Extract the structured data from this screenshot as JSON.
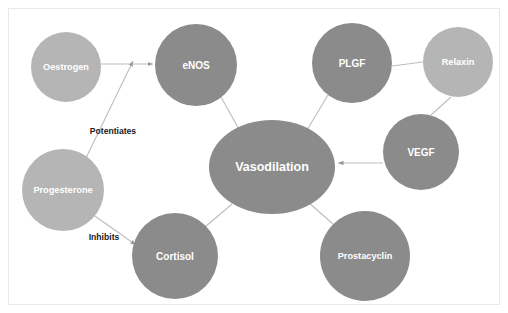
{
  "diagram": {
    "background_color": "#ffffff",
    "frame_color": "#e9e9e9",
    "edge_color": "#bdbdbd",
    "palette": {
      "dark_node": "#8b8b8b",
      "light_node": "#b5b5b5",
      "node_text": "#ffffff",
      "edge_label_text": "#1a1a1a"
    },
    "nodes": [
      {
        "id": "vasodilation",
        "label": "Vasodilation",
        "shape": "ellipse",
        "cx": 272,
        "cy": 167,
        "rx": 63,
        "ry": 47,
        "color": "#8b8b8b",
        "size_class": "center"
      },
      {
        "id": "oestrogen",
        "label": "Oestrogen",
        "shape": "circle",
        "cx": 66,
        "cy": 67,
        "rx": 35,
        "ry": 35,
        "color": "#b5b5b5",
        "size_class": "med"
      },
      {
        "id": "enos",
        "label": "eNOS",
        "shape": "circle",
        "cx": 196,
        "cy": 65,
        "rx": 41,
        "ry": 41,
        "color": "#8b8b8b",
        "size_class": "big"
      },
      {
        "id": "plgf",
        "label": "PLGF",
        "shape": "circle",
        "cx": 352,
        "cy": 63,
        "rx": 40,
        "ry": 40,
        "color": "#8b8b8b",
        "size_class": "big"
      },
      {
        "id": "relaxin",
        "label": "Relaxin",
        "shape": "circle",
        "cx": 458,
        "cy": 62,
        "rx": 35,
        "ry": 35,
        "color": "#b5b5b5",
        "size_class": "med"
      },
      {
        "id": "vegf",
        "label": "VEGF",
        "shape": "circle",
        "cx": 421,
        "cy": 152,
        "rx": 38,
        "ry": 38,
        "color": "#8b8b8b",
        "size_class": "big"
      },
      {
        "id": "progesterone",
        "label": "Progesterone",
        "shape": "circle",
        "cx": 63,
        "cy": 190,
        "rx": 41,
        "ry": 41,
        "color": "#b5b5b5",
        "size_class": "med"
      },
      {
        "id": "cortisol",
        "label": "Cortisol",
        "shape": "circle",
        "cx": 175,
        "cy": 256,
        "rx": 43,
        "ry": 43,
        "color": "#8b8b8b",
        "size_class": "big"
      },
      {
        "id": "prostacyclin",
        "label": "Prostacyclin",
        "shape": "circle",
        "cx": 365,
        "cy": 256,
        "rx": 45,
        "ry": 45,
        "color": "#8b8b8b",
        "size_class": "med"
      }
    ],
    "edges": [
      {
        "id": "oestrogen-enos",
        "from": "oestrogen",
        "to": "enos",
        "label": "",
        "arrow": true,
        "x1": 101,
        "y1": 64,
        "x2": 153,
        "y2": 64
      },
      {
        "id": "progesterone-enos",
        "from": "progesterone",
        "to": "enos",
        "label": "Potentiates",
        "arrow": true,
        "x1": 86,
        "y1": 158,
        "x2": 133,
        "y2": 61
      },
      {
        "id": "progesterone-cortisol",
        "from": "progesterone",
        "to": "cortisol",
        "label": "Inhibits",
        "arrow": true,
        "x1": 92,
        "y1": 214,
        "x2": 136,
        "y2": 245
      },
      {
        "id": "enos-vasodilation",
        "from": "enos",
        "to": "vasodilation",
        "label": "",
        "arrow": false,
        "x1": 221,
        "y1": 97,
        "x2": 240,
        "y2": 131
      },
      {
        "id": "plgf-vasodilation",
        "from": "plgf",
        "to": "vasodilation",
        "label": "",
        "arrow": false,
        "x1": 328,
        "y1": 95,
        "x2": 307,
        "y2": 130
      },
      {
        "id": "plgf-relaxin",
        "from": "plgf",
        "to": "relaxin",
        "label": "",
        "arrow": false,
        "x1": 392,
        "y1": 66,
        "x2": 423,
        "y2": 62
      },
      {
        "id": "relaxin-vegf",
        "from": "relaxin",
        "to": "vegf",
        "label": "",
        "arrow": false,
        "x1": 451,
        "y1": 97,
        "x2": 431,
        "y2": 115
      },
      {
        "id": "vegf-vasodilation",
        "from": "vegf",
        "to": "vasodilation",
        "label": "",
        "arrow": true,
        "x1": 383,
        "y1": 163,
        "x2": 338,
        "y2": 163
      },
      {
        "id": "cortisol-vasodilation",
        "from": "cortisol",
        "to": "vasodilation",
        "label": "",
        "arrow": false,
        "x1": 205,
        "y1": 227,
        "x2": 232,
        "y2": 204
      },
      {
        "id": "prostacyclin-vasodilation",
        "from": "prostacyclin",
        "to": "vasodilation",
        "label": "",
        "arrow": false,
        "x1": 333,
        "y1": 224,
        "x2": 308,
        "y2": 202
      }
    ],
    "edge_labels": [
      {
        "id": "potentiates",
        "text": "Potentiates",
        "x": 113,
        "y": 131
      },
      {
        "id": "inhibits",
        "text": "Inhibits",
        "x": 104,
        "y": 237
      }
    ]
  }
}
